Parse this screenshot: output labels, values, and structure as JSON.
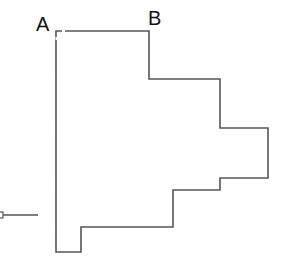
{
  "diagram": {
    "labels": {
      "a": "A",
      "b": "B"
    },
    "colors": {
      "outline": "#555555",
      "text": "#111111",
      "background": "#ffffff"
    },
    "outline_points": "56,31 149,31 149,79 220,79 220,128 268,128 268,178 220,178 220,190 173,190 173,227 81,227 81,252 56,252",
    "lead": {
      "x1": 3,
      "y1": 215,
      "x2": 38,
      "y2": 215
    }
  }
}
